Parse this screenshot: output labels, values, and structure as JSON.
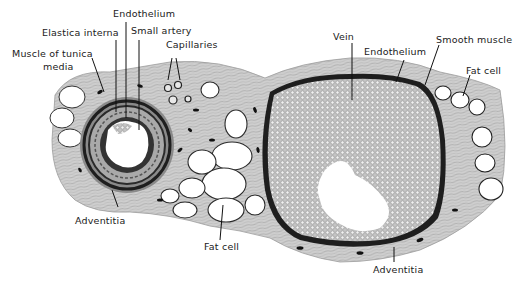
{
  "figure": {
    "colors": {
      "background": "#ffffff",
      "connective_tissue": "#b9b9b9",
      "connective_light": "#d6d6d6",
      "nucleus": "#1a1a1a",
      "blood_cells": "#a8a8a8",
      "vessel_wall": "#3a3a3a",
      "label_text": "#1a1a1a"
    }
  },
  "labels": {
    "endothelium_artery": "Endothelium",
    "elastica_interna": "Elastica interna",
    "small_artery": "Small artery",
    "capillaries": "Capillaries",
    "muscle_tunica_media_line1": "Muscle of tunica",
    "muscle_tunica_media_line2": "media",
    "adventitia_artery": "Adventitia",
    "fat_cell_bottom": "Fat cell",
    "vein": "Vein",
    "endothelium_vein": "Endothelium",
    "smooth_muscle": "Smooth muscle",
    "fat_cell_right": "Fat cell",
    "adventitia_vein": "Adventitia"
  }
}
